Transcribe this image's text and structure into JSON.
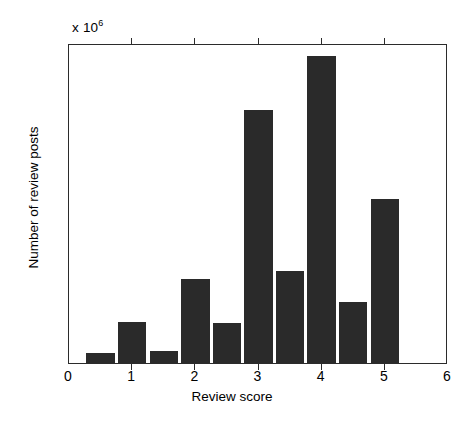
{
  "chart_data": {
    "type": "bar",
    "title": "",
    "subtitle": "",
    "xlabel": "Review score",
    "ylabel": "Number of review posts",
    "y_exponent_label": "x 10",
    "y_exponent_power": "6",
    "y_scale_factor": 1000000,
    "xlim": [
      0,
      6
    ],
    "ylim": [
      0,
      3000000
    ],
    "xticks": [
      "0",
      "1",
      "2",
      "3",
      "4",
      "5",
      "6"
    ],
    "xtick_values": [
      0,
      1,
      2,
      3,
      4,
      5,
      6
    ],
    "yticks": [
      "0",
      "0.5",
      "1",
      "1.5",
      "2",
      "2.5",
      "3"
    ],
    "ytick_values": [
      0,
      500000,
      1000000,
      1500000,
      2000000,
      2500000,
      3000000
    ],
    "grid": false,
    "legend": null,
    "bar_color": "#2a2a2a",
    "axis_color": "#2b2b2b",
    "bar_width": 0.45,
    "x": [
      0.5,
      1.0,
      1.5,
      2.0,
      2.5,
      3.0,
      3.5,
      4.0,
      4.5,
      5.0
    ],
    "categories": [
      "0.5",
      "1",
      "1.5",
      "2",
      "2.5",
      "3",
      "3.5",
      "4",
      "4.5",
      "5"
    ],
    "values": [
      90000,
      380000,
      110000,
      790000,
      375000,
      2370000,
      860000,
      2880000,
      570000,
      1540000
    ],
    "values_scaled": [
      0.09,
      0.38,
      0.11,
      0.79,
      0.375,
      2.37,
      0.86,
      2.88,
      0.57,
      1.54
    ]
  }
}
